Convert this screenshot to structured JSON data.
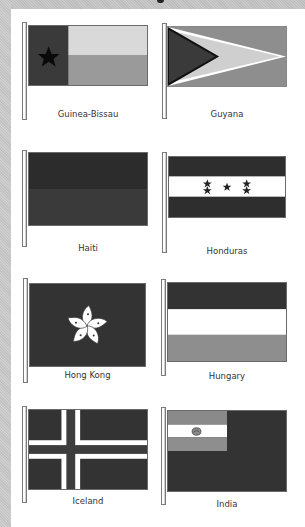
{
  "page": {
    "colors": {
      "dark": "#333333",
      "mid": "#8f8f8f",
      "light": "#d6d6d6",
      "white": "#ffffff",
      "black": "#111111"
    }
  },
  "flags": [
    {
      "name": "Guinea-Bissau",
      "icon": "guinea-bissau-flag"
    },
    {
      "name": "Guyana",
      "icon": "guyana-flag"
    },
    {
      "name": "Haiti",
      "icon": "haiti-flag"
    },
    {
      "name": "Honduras",
      "icon": "honduras-flag"
    },
    {
      "name": "Hong Kong",
      "icon": "hong-kong-flag"
    },
    {
      "name": "Hungary",
      "icon": "hungary-flag"
    },
    {
      "name": "Iceland",
      "icon": "iceland-flag"
    },
    {
      "name": "India",
      "icon": "india-flag"
    }
  ]
}
